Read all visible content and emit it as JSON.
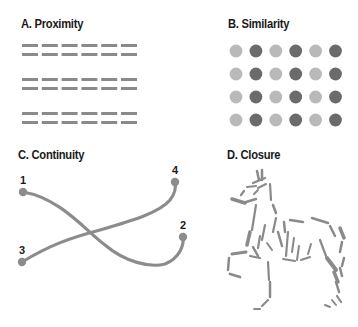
{
  "panels": {
    "proximity": {
      "title": "A. Proximity",
      "dash_color": "#8a8a8a",
      "groups": 3,
      "rows_per_group": 2,
      "dashes_per_row": 6
    },
    "similarity": {
      "title": "B. Similarity",
      "light_color": "#b9b9b9",
      "dark_color": "#6b6b6b",
      "rows": 4,
      "columns": 6,
      "pattern": [
        "light",
        "dark",
        "light",
        "dark",
        "light",
        "dark"
      ]
    },
    "continuity": {
      "title": "C. Continuity",
      "line_color": "#8c8c8c",
      "points": [
        {
          "label": "1",
          "x": 23,
          "y": 192
        },
        {
          "label": "2",
          "x": 183,
          "y": 237
        },
        {
          "label": "3",
          "x": 22,
          "y": 262
        },
        {
          "label": "4",
          "x": 175,
          "y": 182
        }
      ],
      "curves": [
        {
          "from": "1",
          "to": "2"
        },
        {
          "from": "3",
          "to": "4"
        }
      ]
    },
    "closure": {
      "title": "D. Closure",
      "figure": "horse-outline",
      "stroke_color": "#8a8a8a"
    }
  }
}
